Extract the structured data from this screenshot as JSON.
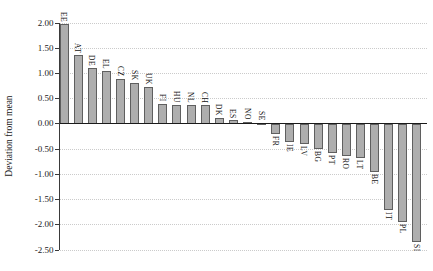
{
  "chart_data": {
    "type": "bar",
    "title": "",
    "xlabel": "",
    "ylabel": "Deviation from mean",
    "ylim": [
      -2.5,
      2.0
    ],
    "grid": "horizontal-dotted",
    "legend": "none",
    "bar_fill_color": "#aeaeae",
    "bar_border_color": "#5f5f5f",
    "grid_color": "#cbcbcb",
    "zero_line_color": "#1a1a1a",
    "yticks": [
      2.0,
      1.5,
      1.0,
      0.5,
      0.0,
      -0.5,
      -1.0,
      -1.5,
      -2.0,
      -2.5
    ],
    "ytick_labels": [
      "2.00",
      "1.50",
      "1.00",
      "0.50",
      "0.00",
      "-0.50",
      "-1.00",
      "-1.50",
      "-2.00",
      "-2.50"
    ],
    "categories": [
      "EE",
      "AT",
      "DE",
      "EL",
      "CZ",
      "SK",
      "UK",
      "FI",
      "HU",
      "NL",
      "CH",
      "DK",
      "ES",
      "NO",
      "SE",
      "FR",
      "IE",
      "LV",
      "BG",
      "PT",
      "RO",
      "LT",
      "BE",
      "IT",
      "PL",
      "SI"
    ],
    "values": [
      1.98,
      1.37,
      1.11,
      1.05,
      0.89,
      0.81,
      0.73,
      0.4,
      0.37,
      0.37,
      0.37,
      0.12,
      0.07,
      0.04,
      0.02,
      -0.21,
      -0.35,
      -0.4,
      -0.5,
      -0.58,
      -0.63,
      -0.68,
      -0.95,
      -1.7,
      -1.95,
      -2.35
    ]
  }
}
